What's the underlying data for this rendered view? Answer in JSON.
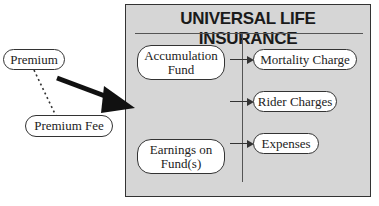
{
  "diagram": {
    "title": "UNIVERSAL LIFE INSURANCE",
    "outside_nodes": {
      "premium": "Premium",
      "premium_fee": "Premium Fee"
    },
    "left_nodes": {
      "accumulation_fund": "Accumulation Fund",
      "earnings_on_funds": "Earnings on Fund(s)"
    },
    "right_nodes": {
      "mortality_charge": "Mortality Charge",
      "rider_charges": "Rider Charges",
      "expenses": "Expenses"
    },
    "colors": {
      "panel_background": "#d6d6d6",
      "node_fill": "#ffffff",
      "stroke": "#333333"
    }
  }
}
